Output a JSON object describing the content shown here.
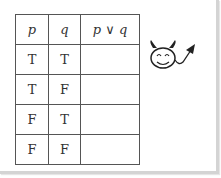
{
  "table": {
    "headers": [
      "p",
      "q",
      "p ∨ q"
    ],
    "rows": [
      [
        "T",
        "T",
        ""
      ],
      [
        "T",
        "F",
        ""
      ],
      [
        "F",
        "T",
        ""
      ],
      [
        "F",
        "F",
        ""
      ]
    ]
  },
  "illustration": {
    "icon": "devil-face-icon"
  }
}
